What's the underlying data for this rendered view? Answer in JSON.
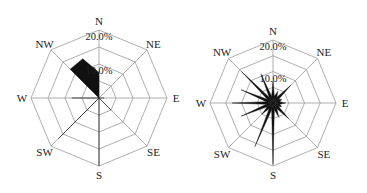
{
  "chart_data": [
    {
      "type": "polar-bar",
      "title": "",
      "directions": [
        "N",
        "NNE",
        "NE",
        "ENE",
        "E",
        "ESE",
        "SE",
        "SSE",
        "S",
        "SSW",
        "SW",
        "WSW",
        "W",
        "WNW",
        "NW",
        "NNW"
      ],
      "axis_labels": [
        "N",
        "NE",
        "E",
        "SE",
        "S",
        "SW",
        "W",
        "NW"
      ],
      "ring_labels": [
        "10.0%",
        "20.0%"
      ],
      "rmax": 20,
      "ring_step": 5,
      "values": [
        7.5,
        0,
        0,
        0,
        1.5,
        0,
        5,
        0,
        20,
        0,
        17,
        0,
        8,
        0,
        12,
        12.5
      ],
      "render": "polygon",
      "center": [
        99,
        98
      ],
      "radius": 68
    },
    {
      "type": "polar-bar",
      "title": "",
      "directions": [
        "N",
        "NNE",
        "NE",
        "ENE",
        "E",
        "ESE",
        "SE",
        "SSE",
        "S",
        "SSW",
        "SW",
        "WSW",
        "W",
        "WNW",
        "NW",
        "NNW"
      ],
      "axis_labels": [
        "N",
        "NE",
        "E",
        "SE",
        "S",
        "SW",
        "W",
        "NW"
      ],
      "ring_labels": [
        "10.0%",
        "20.0%"
      ],
      "rmax": 20,
      "ring_step": 5,
      "values": [
        7,
        4,
        8,
        3,
        4,
        3,
        7,
        5,
        19.5,
        15,
        5,
        11,
        13,
        11,
        14,
        10
      ],
      "render": "spikes",
      "center": [
        273,
        103
      ],
      "radius": 63
    }
  ]
}
